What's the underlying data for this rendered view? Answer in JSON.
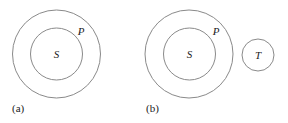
{
  "diagram": {
    "stroke_color": "#8a8a8a",
    "text_color": "#222222",
    "panels": [
      {
        "label": "(a)",
        "outer": {
          "label": "P"
        },
        "inner": {
          "label": "S"
        }
      },
      {
        "label": "(b)",
        "outer": {
          "label": "P"
        },
        "inner": {
          "label": "S"
        },
        "separate": {
          "label": "T"
        }
      }
    ]
  }
}
